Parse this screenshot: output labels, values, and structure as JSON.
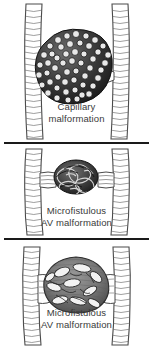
{
  "figure": {
    "background_color": "#ffffff",
    "ink_color": "#2b2b2b",
    "caption_color": "#3a3a3a",
    "divider_color": "#1a1a1a"
  },
  "panels": [
    {
      "id": "capillary-malformation",
      "caption_line_1": "Capillary",
      "caption_line_2": "malformation",
      "nidus_description": "dense dark globular cluster of tiny capillary loops",
      "vessel_left": "feeding artery",
      "vessel_right": "draining vein"
    },
    {
      "id": "microfistulous-av-malformation",
      "caption_line_1": "Microfistulous",
      "caption_line_2": "AV malformation",
      "nidus_description": "small compact tangle of fine fistulous channels",
      "vessel_left": "feeding artery",
      "vessel_right": "draining vein"
    },
    {
      "id": "macrofistulous-av-malformation",
      "caption_line_1": "Microfistulous",
      "caption_line_2": "AV malformation",
      "nidus_description": "large open sac with several coarse serpentine channels",
      "vessel_left": "feeding artery",
      "vessel_right": "draining vein"
    }
  ]
}
